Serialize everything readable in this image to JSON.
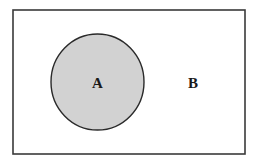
{
  "diagram": {
    "type": "venn",
    "universe": {
      "label": "B",
      "x": 13,
      "y": 10,
      "width": 232,
      "height": 144,
      "stroke": "#3a3a3a",
      "fill": "#ffffff"
    },
    "sets": [
      {
        "label": "A",
        "cx": 97.5,
        "cy": 82,
        "rx": 46.5,
        "ry": 48,
        "fill": "#d2d2d2",
        "stroke": "#2a2a2a"
      }
    ],
    "labels": {
      "a": "A",
      "b": "B"
    }
  }
}
